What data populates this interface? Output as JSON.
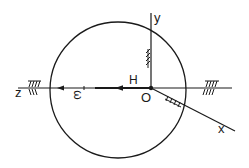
{
  "diagram": {
    "labels": {
      "z_axis": "z",
      "y_axis": "y",
      "x_axis": "x",
      "origin": "O",
      "angular_momentum": "H",
      "angular_velocity": "ω"
    },
    "colors": {
      "stroke": "#1a1a1a",
      "background": "#ffffff"
    }
  }
}
